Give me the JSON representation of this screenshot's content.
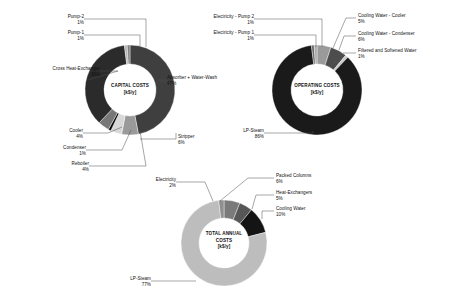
{
  "figure": {
    "background": "#ffffff",
    "leader_color": "#4d4d4d"
  },
  "chart_data": [
    {
      "id": "capital-costs",
      "type": "pie",
      "variant": "donut",
      "title": "CAPITAL COSTS",
      "unit": "[k$/y]",
      "center": {
        "cx": 130,
        "cy": 90,
        "r_outer": 45,
        "r_inner": 26
      },
      "start_angle_deg": -90,
      "categories": [
        "Absorber + Water-Wash",
        "Stripper",
        "Reboiler",
        "Condenser",
        "Cooler",
        "Cross Heat-Exchanger",
        "Pump-1",
        "Pump-2"
      ],
      "values": [
        47,
        6,
        4,
        1,
        4,
        36,
        1,
        1
      ],
      "labels": [
        "Absorber + Water-Wash",
        "Stripper",
        "Reboiler",
        "Condenser",
        "Cooler",
        "Cross Heat-Exchanger",
        "Pump-1",
        "Pump-2"
      ],
      "percent_labels": [
        "47%",
        "6%",
        "4%",
        "1%",
        "4%",
        "36%",
        "1%",
        "1%"
      ],
      "colors": [
        "#3f3f3f",
        "#9a9a9a",
        "#d8d8d8",
        "#0d0d0d",
        "#777777",
        "#2b2b2b",
        "#b5b5b5",
        "#808080"
      ]
    },
    {
      "id": "operating-costs",
      "type": "pie",
      "variant": "donut",
      "title": "OPERATING COSTS",
      "unit": "[k$/y]",
      "center": {
        "cx": 317,
        "cy": 90,
        "r_outer": 45,
        "r_inner": 26
      },
      "start_angle_deg": -90,
      "categories": [
        "Cooling Water - Cooler",
        "Cooling Water - Condenser",
        "Filtered and Softened Water",
        "LP-Steam",
        "Electricity - Pump 1",
        "Electricity - Pump 2"
      ],
      "values": [
        5,
        6,
        1,
        86,
        1,
        1
      ],
      "labels": [
        "Cooling Water - Cooler",
        "Cooling Water - Condenser",
        "Filtered and Softened Water",
        "LP-Steam",
        "Electricity - Pump 1",
        "Electricity - Pump 2"
      ],
      "percent_labels": [
        "5%",
        "6%",
        "1%",
        "86%",
        "1%",
        "1%"
      ],
      "colors": [
        "#9a9a9a",
        "#4d4d4d",
        "#c9c9c9",
        "#1a1a1a",
        "#6b6b6b",
        "#a8a8a8"
      ]
    },
    {
      "id": "total-annual-costs",
      "type": "pie",
      "variant": "donut",
      "title": "TOTAL ANNUAL COSTS",
      "unit": "[k$/y]",
      "center": {
        "cx": 224,
        "cy": 243,
        "r_outer": 43,
        "r_inner": 25
      },
      "start_angle_deg": -90,
      "categories": [
        "Packed Columns",
        "Heat-Exchangers",
        "Cooling Water",
        "LP-Steam",
        "Electricity"
      ],
      "values": [
        6,
        5,
        10,
        77,
        2
      ],
      "labels": [
        "Packed Columns",
        "Heat-Exchangers",
        "Cooling Water",
        "LP-Steam",
        "Electricity"
      ],
      "percent_labels": [
        "6%",
        "5%",
        "10%",
        "77%",
        "2%"
      ],
      "colors": [
        "#7a7a7a",
        "#575757",
        "#141414",
        "#bdbdbd",
        "#8f8f8f"
      ]
    }
  ],
  "capital": {
    "center_title": "CAPITAL COSTS",
    "center_unit": "[k$/y]",
    "labels": {
      "pump2": "Pump-2",
      "pump2_pct": "1%",
      "pump1": "Pump-1",
      "pump1_pct": "1%",
      "cross_hx": "Cross Heat-Exchanger",
      "cross_hx_pct": "36%",
      "cooler": "Cooler",
      "cooler_pct": "4%",
      "condenser": "Condenser",
      "condenser_pct": "1%",
      "reboiler": "Reboiler",
      "reboiler_pct": "4%",
      "absorber": "Absorber + Water-Wash",
      "absorber_pct": "47%",
      "stripper": "Stripper",
      "stripper_pct": "6%"
    }
  },
  "operating": {
    "center_title": "OPERATING COSTS",
    "center_unit": "[k$/y]",
    "labels": {
      "elec_pump2": "Electricity - Pump 2",
      "elec_pump2_pct": "1%",
      "elec_pump1": "Electricity - Pump 1",
      "elec_pump1_pct": "1%",
      "cw_cooler": "Cooling Water - Cooler",
      "cw_cooler_pct": "5%",
      "cw_condenser": "Cooling Water - Condenser",
      "cw_condenser_pct": "6%",
      "filtered_water": "Filtered and Softened Water",
      "filtered_water_pct": "1%",
      "lp_steam": "LP-Steam",
      "lp_steam_pct": "86%"
    }
  },
  "total": {
    "center_title_line1": "TOTAL ANNUAL",
    "center_title_line2": "COSTS",
    "center_unit": "[k$/y]",
    "labels": {
      "electricity": "Electricity",
      "electricity_pct": "2%",
      "packed_columns": "Packed Columns",
      "packed_columns_pct": "6%",
      "heat_exchangers": "Heat-Exchangers",
      "heat_exchangers_pct": "5%",
      "cooling_water": "Cooling Water",
      "cooling_water_pct": "10%",
      "lp_steam": "LP-Steam",
      "lp_steam_pct": "77%"
    }
  }
}
